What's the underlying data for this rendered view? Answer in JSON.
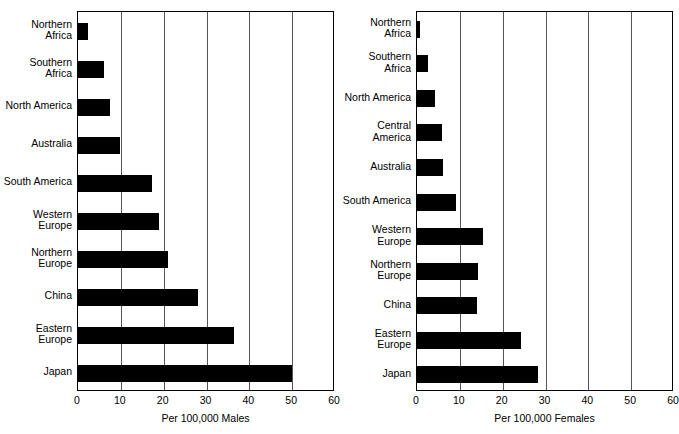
{
  "figure": {
    "background_color": "#ffffff",
    "bar_color": "#000000",
    "grid_color": "#555555",
    "axis_color": "#000000"
  },
  "chart_data": [
    {
      "type": "bar",
      "orientation": "horizontal",
      "panel": "left",
      "title": "",
      "xlabel": "Per 100,000 Males",
      "ylabel": "",
      "xlim": [
        0,
        60
      ],
      "ylim": null,
      "grid": true,
      "grid_axis": "x",
      "legend": "none",
      "xticks": [
        0,
        10,
        20,
        30,
        40,
        50,
        60
      ],
      "xticklabels": [
        "0",
        "10",
        "20",
        "30",
        "40",
        "50",
        "60"
      ],
      "categories": [
        "Northern\nAfrica",
        "Southern\nAfrica",
        "North America",
        "Australia",
        "South America",
        "Western\nEurope",
        "Northern\nEurope",
        "China",
        "Eastern\nEurope",
        "Japan"
      ],
      "values": [
        2.3,
        6.0,
        7.4,
        9.8,
        17.2,
        19.0,
        21.0,
        28.0,
        36.5,
        50.0
      ]
    },
    {
      "type": "bar",
      "orientation": "horizontal",
      "panel": "right",
      "title": "",
      "xlabel": "Per 100,000 Females",
      "ylabel": "",
      "xlim": [
        0,
        60
      ],
      "ylim": null,
      "grid": true,
      "grid_axis": "x",
      "legend": "none",
      "xticks": [
        0,
        10,
        20,
        30,
        40,
        50,
        60
      ],
      "xticklabels": [
        "0",
        "10",
        "20",
        "30",
        "40",
        "50",
        "60"
      ],
      "categories": [
        "Northern\nAfrica",
        "Southern\nAfrica",
        "North America",
        "Central\nAmerica",
        "Australia",
        "South America",
        "Western\nEurope",
        "Northern\nEurope",
        "China",
        "Eastern\nEurope",
        "Japan"
      ],
      "values": [
        0.8,
        2.5,
        4.3,
        5.8,
        6.0,
        9.0,
        15.3,
        14.2,
        13.9,
        24.3,
        28.3
      ]
    }
  ]
}
